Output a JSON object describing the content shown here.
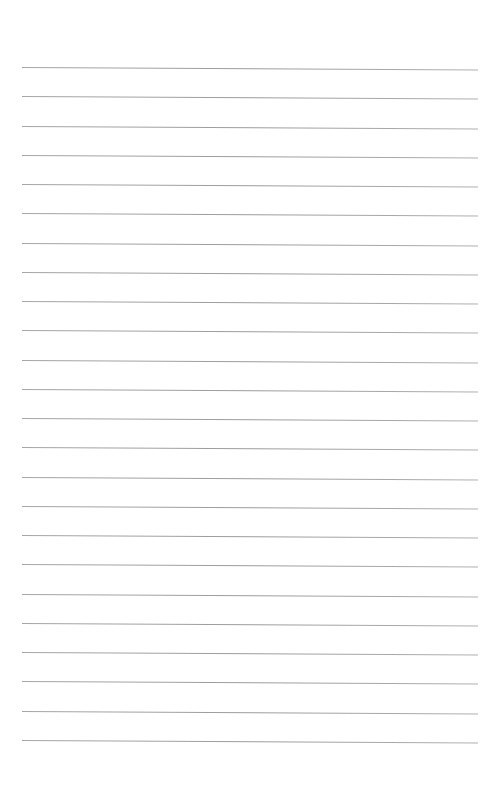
{
  "page": {
    "type": "lined-paper",
    "background_color": "#ffffff",
    "rule_color": "#a3a3a3",
    "rule_count": 24,
    "rule_left": 22,
    "rule_right": 478,
    "first_rule_y": 67,
    "rule_spacing": 29.26
  }
}
